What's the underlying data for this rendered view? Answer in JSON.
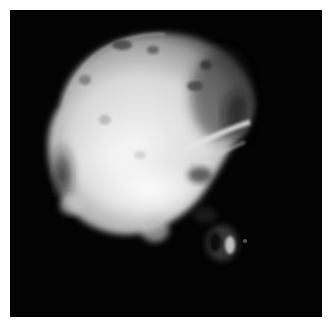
{
  "image": {
    "subject": "lateral skull radiograph",
    "style": "grayscale x-ray",
    "background_color": "#030303",
    "border_color": "#ffffff",
    "panel": {
      "x": 10,
      "y": 10,
      "width": 312,
      "height": 307
    }
  }
}
